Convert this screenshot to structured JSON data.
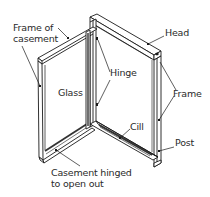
{
  "diagram": {
    "labels": {
      "frame_of_casement_line1": "Frame of",
      "frame_of_casement_line2": "casement",
      "head": "Head",
      "hinge": "Hinge",
      "glass": "Glass",
      "frame": "Frame",
      "cill": "Cill",
      "post": "Post",
      "casement_line1": "Casement hinged",
      "casement_line2": "to open out"
    },
    "colors": {
      "line": "#1a1a1a",
      "background": "#ffffff",
      "glass_fill": "#ffffff"
    }
  }
}
